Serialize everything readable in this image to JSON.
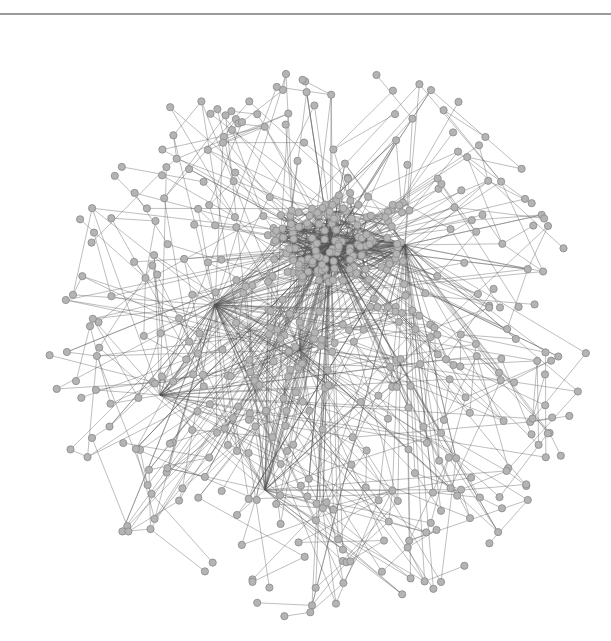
{
  "figure": {
    "type": "network-graph",
    "width": 611,
    "height": 641,
    "background": "#ffffff",
    "top_rule_color": "#8a8a8a",
    "node_fill": "#b4b4b4",
    "node_stroke": "#8f8f8f",
    "edge_color": "#555555",
    "node_radius": 3.6,
    "layout": {
      "center": [
        318,
        340
      ],
      "radius_x": 270,
      "radius_y": 300,
      "outer_node_count": 430,
      "core": {
        "center": [
          335,
          240
        ],
        "radius": 55,
        "node_count": 110
      },
      "hubs": [
        {
          "name": "core-hub",
          "pos": [
            330,
            245
          ],
          "degree": 160
        },
        {
          "name": "right-hub",
          "pos": [
            405,
            245
          ],
          "degree": 90
        },
        {
          "name": "left-hub",
          "pos": [
            215,
            305
          ],
          "degree": 80
        },
        {
          "name": "lower-left-hub",
          "pos": [
            160,
            395
          ],
          "degree": 35
        },
        {
          "name": "lower-hub",
          "pos": [
            265,
            490
          ],
          "degree": 40
        },
        {
          "name": "mid-hub",
          "pos": [
            300,
            350
          ],
          "degree": 50
        }
      ],
      "chain_edges_per_node": 1,
      "seed": 7
    }
  }
}
